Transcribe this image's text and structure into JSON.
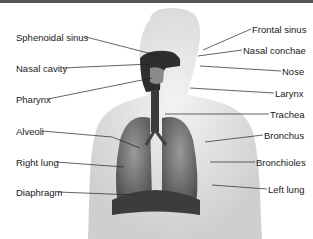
{
  "diagram": {
    "labels_left": [
      {
        "id": "sphenoidal-sinus",
        "text": "Sphenoidal sinus",
        "x": 16,
        "y": 32
      },
      {
        "id": "nasal-cavity",
        "text": "Nasal cavity",
        "x": 16,
        "y": 63
      },
      {
        "id": "pharynx",
        "text": "Pharynx",
        "x": 16,
        "y": 94
      },
      {
        "id": "alveoli",
        "text": "Alveoli",
        "x": 16,
        "y": 126
      },
      {
        "id": "right-lung",
        "text": "Right lung",
        "x": 16,
        "y": 157
      },
      {
        "id": "diaphragm",
        "text": "Diaphragm",
        "x": 16,
        "y": 187
      }
    ],
    "labels_right": [
      {
        "id": "frontal-sinus",
        "text": "Frontal sinus",
        "x": 252,
        "y": 24
      },
      {
        "id": "nasal-conchae",
        "text": "Nasal conchae",
        "x": 243,
        "y": 45
      },
      {
        "id": "nose",
        "text": "Nose",
        "x": 282,
        "y": 66
      },
      {
        "id": "larynx",
        "text": "Larynx",
        "x": 275,
        "y": 88
      },
      {
        "id": "trachea",
        "text": "Trachea",
        "x": 270,
        "y": 109
      },
      {
        "id": "bronchus",
        "text": "Bronchus",
        "x": 264,
        "y": 130
      },
      {
        "id": "bronchioles",
        "text": "Bronchioles",
        "x": 256,
        "y": 157
      },
      {
        "id": "left-lung",
        "text": "Left lung",
        "x": 268,
        "y": 184
      }
    ],
    "colors": {
      "body": "#e6e6e6",
      "airway": "#333333",
      "lung": "#6e6e6e",
      "line": "#222222"
    }
  }
}
